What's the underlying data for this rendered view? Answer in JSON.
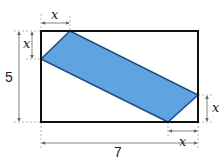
{
  "diagram": {
    "type": "geometry",
    "rectangle": {
      "width_label": "7",
      "height_label": "5",
      "stroke": "#111111"
    },
    "parallelogram": {
      "fill": "#5fa3e0",
      "stroke": "#1f4f8a"
    },
    "labels": {
      "top_x": "x",
      "left_x": "x",
      "right_x": "x",
      "bottom_x": "x",
      "width": "7",
      "height": "5"
    }
  }
}
